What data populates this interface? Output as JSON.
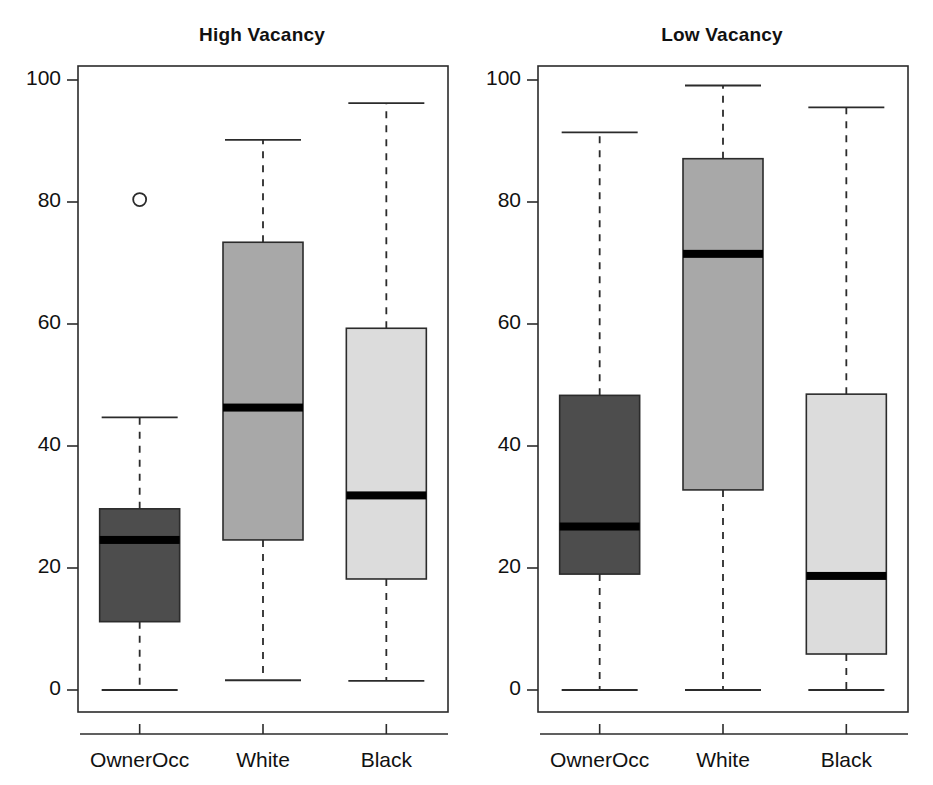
{
  "figure": {
    "width": 933,
    "height": 785,
    "background": "#ffffff"
  },
  "chart_data": [
    {
      "type": "box",
      "title": "High Vacancy",
      "xlabel": "",
      "ylabel": "",
      "ylim": [
        0,
        100
      ],
      "yticks": [
        0,
        20,
        40,
        60,
        80,
        100
      ],
      "ytick_labels": [
        "0",
        "20",
        "40",
        "60",
        "80",
        "100"
      ],
      "grid": false,
      "legend": "none",
      "categories": [
        "OwnerOcc",
        "White",
        "Black"
      ],
      "boxes": [
        {
          "name": "OwnerOcc",
          "whisker_low": 0.0,
          "q1": 11.2,
          "median": 24.6,
          "q3": 29.7,
          "whisker_high": 44.7,
          "outliers": [
            80.4
          ],
          "fill": "#4d4d4d"
        },
        {
          "name": "White",
          "whisker_low": 1.6,
          "q1": 24.6,
          "median": 46.3,
          "q3": 73.4,
          "whisker_high": 90.2,
          "outliers": [],
          "fill": "#a8a8a8"
        },
        {
          "name": "Black",
          "whisker_low": 1.5,
          "q1": 18.2,
          "median": 31.9,
          "q3": 59.3,
          "whisker_high": 96.2,
          "outliers": [],
          "fill": "#dcdcdc"
        }
      ]
    },
    {
      "type": "box",
      "title": "Low Vacancy",
      "xlabel": "",
      "ylabel": "",
      "ylim": [
        0,
        100
      ],
      "yticks": [
        0,
        20,
        40,
        60,
        80,
        100
      ],
      "ytick_labels": [
        "0",
        "20",
        "40",
        "60",
        "80",
        "100"
      ],
      "grid": false,
      "legend": "none",
      "categories": [
        "OwnerOcc",
        "White",
        "Black"
      ],
      "boxes": [
        {
          "name": "OwnerOcc",
          "whisker_low": 0.0,
          "q1": 19.0,
          "median": 26.8,
          "q3": 48.3,
          "whisker_high": 91.4,
          "outliers": [],
          "fill": "#4d4d4d"
        },
        {
          "name": "White",
          "whisker_low": 0.0,
          "q1": 32.8,
          "median": 71.5,
          "q3": 87.1,
          "whisker_high": 99.1,
          "outliers": [],
          "fill": "#a8a8a8"
        },
        {
          "name": "Black",
          "whisker_low": 0.0,
          "q1": 5.9,
          "median": 18.7,
          "q3": 48.5,
          "whisker_high": 95.5,
          "outliers": [],
          "fill": "#dcdcdc"
        }
      ]
    }
  ],
  "style": {
    "axis_color": "#2b2b2b",
    "box_border": "#2b2b2b",
    "median_color": "#000000",
    "whisker_color": "#2b2b2b",
    "outlier_stroke": "#2b2b2b"
  }
}
